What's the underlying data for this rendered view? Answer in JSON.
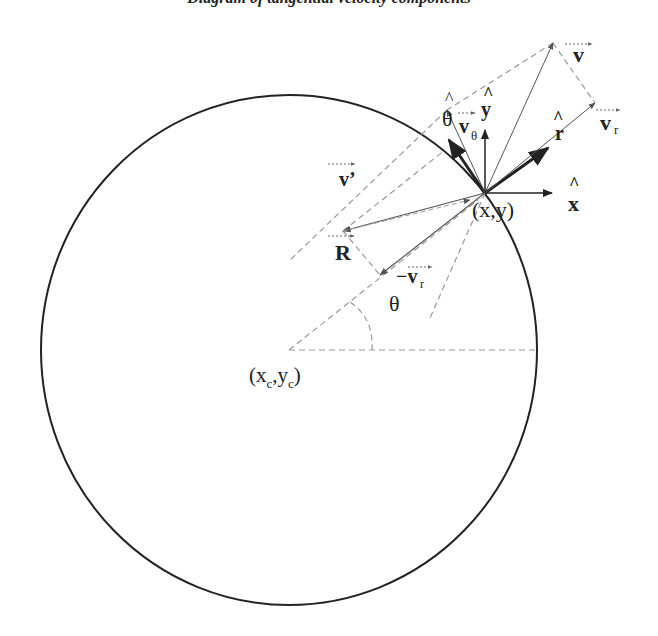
{
  "caption": "Diagram of tangential velocity components",
  "colors": {
    "ink": "#222222",
    "gray": "#555555",
    "dashed": "#999999",
    "background": "#ffffff"
  },
  "circle": {
    "cx": 289,
    "cy": 350,
    "rx": 248,
    "ry": 255
  },
  "points": {
    "center": {
      "label_x": "x",
      "label_sub_x": "c",
      "label_y": "y",
      "label_sub_y": "c"
    },
    "contact": {
      "label": "(x,y)"
    }
  },
  "labels": {
    "theta_hat": "θ",
    "hat": "^",
    "y_hat": "y",
    "x_hat": "x",
    "r_hat": "r",
    "v": "v",
    "v_r": "v",
    "v_r_sub": "r",
    "v_theta": "v",
    "v_theta_sub": "θ",
    "v_prime": "v’",
    "R": "R",
    "neg_v_r": "−v",
    "neg_v_r_sub": "r",
    "theta": "θ",
    "center_open": "(x",
    "center_sub_c1": "c",
    "center_comma": ",y",
    "center_sub_c2": "c",
    "center_close": ")",
    "contact": "(x,y)"
  }
}
